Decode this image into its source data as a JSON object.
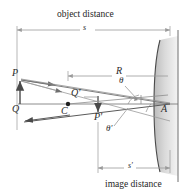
{
  "figure": {
    "title_top": "object distance",
    "title_bottom": "image distance",
    "dimensions": {
      "object_distance_symbol": "s",
      "radius_symbol": "R",
      "image_distance_symbol": "s'"
    },
    "points": {
      "object_tip": "P",
      "object_base": "Q",
      "center_of_curvature": "C",
      "image_base_top": "Q'",
      "image_tip": "P'",
      "vertex": "A"
    },
    "angles": {
      "incidence": "θ",
      "reflection": "θ'"
    },
    "colors": {
      "ink": "#3a3a3a",
      "ray": "#8d8d8d",
      "dim": "#9a9a9a",
      "mirror": "#4a4a4a",
      "mirror_fill": "#d9d9d9",
      "text": "#2b2b2b"
    }
  }
}
